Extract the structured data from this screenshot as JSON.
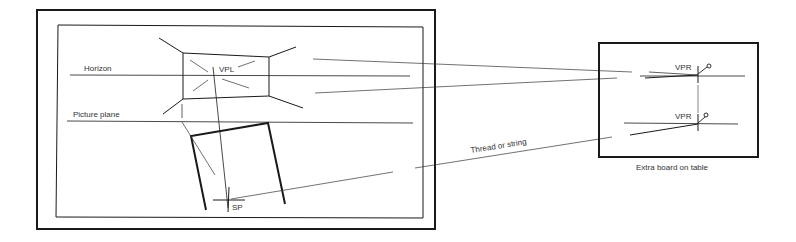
{
  "diagram": {
    "type": "perspective drawing setup",
    "labels": {
      "horizon": "Horizon",
      "picture_plane": "Picture plane",
      "vpl": "VPL",
      "sp": "SP",
      "vpr_top": "VPR",
      "vpr_bottom": "VPR",
      "thread": "Thread or string",
      "extra_board": "Extra board on table"
    },
    "colors": {
      "ink": "#1a1a1a",
      "text": "#333333",
      "background": "#ffffff"
    }
  }
}
